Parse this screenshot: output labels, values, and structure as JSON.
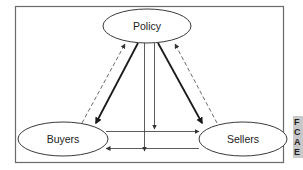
{
  "diagram": {
    "nodes": [
      {
        "id": "policy",
        "label": "Policy"
      },
      {
        "id": "buyers",
        "label": "Buyers"
      },
      {
        "id": "sellers",
        "label": "Sellers"
      }
    ],
    "edges": [
      {
        "from": "policy",
        "to": "buyers",
        "style": "thick-solid"
      },
      {
        "from": "policy",
        "to": "sellers",
        "style": "thick-solid"
      },
      {
        "from": "buyers",
        "to": "policy",
        "style": "dashed"
      },
      {
        "from": "sellers",
        "to": "policy",
        "style": "dashed"
      },
      {
        "from": "buyers",
        "to": "sellers",
        "style": "thin-solid"
      },
      {
        "from": "sellers",
        "to": "buyers",
        "style": "thin-solid"
      },
      {
        "from": "policy",
        "to": "buyers-sellers-link-lower",
        "style": "thin-solid"
      },
      {
        "from": "policy",
        "to": "buyers-sellers-link-upper",
        "style": "thin-solid"
      }
    ]
  },
  "side_tab": {
    "glyphs": [
      "F",
      "C",
      "A",
      "E"
    ]
  }
}
